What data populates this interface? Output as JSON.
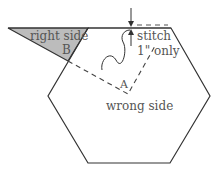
{
  "diagram": {
    "labels": {
      "right_side": "right side",
      "point_b": "B",
      "stitch": "stitch",
      "stitch_amount": "1\" only",
      "point_a": "A",
      "wrong_side": "wrong side"
    },
    "colors": {
      "outline": "#333333",
      "triangle_fill": "#bcbcbc",
      "text": "#555555"
    }
  }
}
